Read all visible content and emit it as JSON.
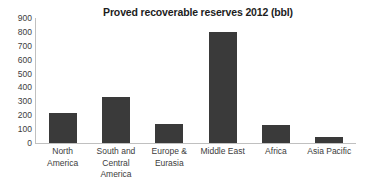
{
  "chart_data": {
    "type": "bar",
    "title": "Proved recoverable reserves 2012 (bbl)",
    "xlabel": "",
    "ylabel": "",
    "ylim": [
      0,
      900
    ],
    "ytick_step": 100,
    "yticks": [
      "900",
      "800",
      "700",
      "600",
      "500",
      "400",
      "300",
      "200",
      "100",
      "0"
    ],
    "grid": false,
    "legend": false,
    "bar_color": "#3a3a3a",
    "axis_color": "#c0c0c0",
    "categories": [
      "North America",
      "South and Central America",
      "Europe & Eurasia",
      "Middle East",
      "Africa",
      "Asia Pacific"
    ],
    "category_lines": [
      [
        "North",
        "America"
      ],
      [
        "South and",
        "Central",
        "America"
      ],
      [
        "Europe &",
        "Eurasia"
      ],
      [
        "Middle East"
      ],
      [
        "Africa"
      ],
      [
        "Asia Pacific"
      ]
    ],
    "values": [
      215,
      330,
      140,
      800,
      130,
      40
    ]
  }
}
